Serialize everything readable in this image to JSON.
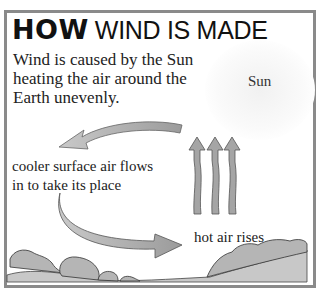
{
  "diagram": {
    "title_bold": "HOW",
    "title_rest": "WIND IS MADE",
    "intro_lines": [
      "Wind is caused by the Sun",
      "heating the air around the",
      "Earth unevenly."
    ],
    "sun_label": "Sun",
    "cooler_lines": [
      "cooler surface air flows",
      "in to take its place"
    ],
    "hot_label": "hot air rises",
    "colors": {
      "border": "#8a8a8a",
      "arrow_fill": "#a9a9a9",
      "arrow_stroke": "#555555",
      "ground": "#c8c8c8",
      "bush": "#b4b4b4"
    }
  }
}
